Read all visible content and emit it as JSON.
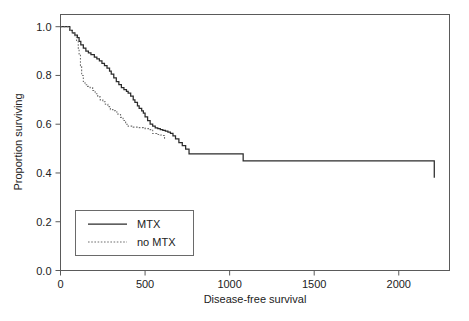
{
  "chart_data": {
    "type": "line",
    "title": "",
    "subtitle": "",
    "xlabel": "Disease-free survival",
    "ylabel": "Proportion surviving",
    "xlim": [
      0,
      2300
    ],
    "ylim": [
      0.0,
      1.05
    ],
    "grid": false,
    "legend_position": "bottom-left",
    "x_ticks": [
      0,
      500,
      1000,
      1500,
      2000
    ],
    "x_tick_labels": [
      "0",
      "500",
      "1000",
      "1500",
      "2000"
    ],
    "y_ticks": [
      0.0,
      0.2,
      0.4,
      0.6,
      0.8,
      1.0
    ],
    "y_tick_labels": [
      "0.0",
      "0.2",
      "0.4",
      "0.6",
      "0.8",
      "1.0"
    ],
    "series": [
      {
        "name": "MTX",
        "style": "solid",
        "color": "#2b2b2b",
        "x": [
          0,
          40,
          55,
          70,
          85,
          100,
          110,
          120,
          135,
          150,
          165,
          180,
          200,
          215,
          230,
          245,
          260,
          275,
          290,
          300,
          315,
          330,
          345,
          360,
          375,
          390,
          400,
          415,
          430,
          440,
          455,
          465,
          480,
          490,
          500,
          515,
          530,
          545,
          560,
          575,
          590,
          605,
          620,
          635,
          650,
          665,
          680,
          700,
          720,
          740,
          760,
          1070,
          1080,
          2200,
          2210
        ],
        "y": [
          1.0,
          1.0,
          0.985,
          0.975,
          0.965,
          0.955,
          0.94,
          0.925,
          0.912,
          0.9,
          0.893,
          0.885,
          0.875,
          0.868,
          0.86,
          0.85,
          0.84,
          0.83,
          0.818,
          0.805,
          0.79,
          0.775,
          0.762,
          0.75,
          0.742,
          0.735,
          0.728,
          0.715,
          0.7,
          0.69,
          0.675,
          0.665,
          0.655,
          0.645,
          0.63,
          0.615,
          0.6,
          0.592,
          0.585,
          0.582,
          0.578,
          0.575,
          0.572,
          0.568,
          0.562,
          0.552,
          0.54,
          0.525,
          0.512,
          0.498,
          0.478,
          0.478,
          0.45,
          0.45,
          0.38
        ]
      },
      {
        "name": "no MTX",
        "style": "dotted",
        "color": "#6e6e6e",
        "x": [
          0,
          40,
          55,
          70,
          85,
          95,
          105,
          110,
          118,
          125,
          135,
          145,
          160,
          175,
          190,
          205,
          220,
          235,
          250,
          265,
          280,
          295,
          310,
          325,
          340,
          355,
          370,
          385,
          400,
          430,
          460,
          490,
          500,
          520,
          545,
          570,
          590,
          600,
          615,
          620
        ],
        "y": [
          1.0,
          1.0,
          0.985,
          0.972,
          0.958,
          0.94,
          0.912,
          0.885,
          0.84,
          0.8,
          0.775,
          0.762,
          0.755,
          0.75,
          0.738,
          0.725,
          0.712,
          0.7,
          0.692,
          0.682,
          0.672,
          0.66,
          0.655,
          0.65,
          0.64,
          0.628,
          0.615,
          0.6,
          0.592,
          0.588,
          0.586,
          0.584,
          0.582,
          0.578,
          0.562,
          0.558,
          0.556,
          0.554,
          0.54,
          0.54
        ]
      }
    ],
    "legend_entries": [
      {
        "label": "MTX",
        "style": "solid"
      },
      {
        "label": "no MTX",
        "style": "dotted"
      }
    ]
  },
  "legend": {
    "items": [
      {
        "label": "MTX"
      },
      {
        "label": "no MTX"
      }
    ]
  },
  "axes": {
    "x_title": "Disease-free survival",
    "y_title": "Proportion surviving"
  }
}
